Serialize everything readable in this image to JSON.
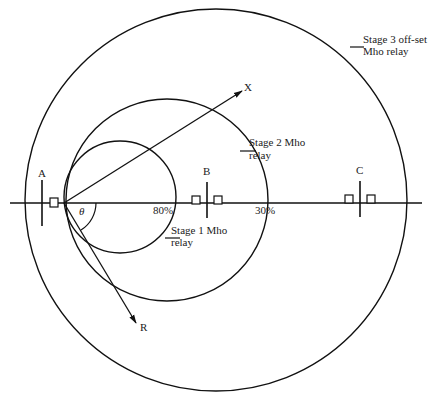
{
  "diagram": {
    "colors": {
      "line": "#111111",
      "text": "#222222",
      "background": "#ffffff"
    },
    "axes": {
      "x_label": "X",
      "r_label": "R",
      "angle_label": "θ"
    },
    "buses": [
      {
        "id": "A",
        "label": "A"
      },
      {
        "id": "B",
        "label": "B"
      },
      {
        "id": "C",
        "label": "C"
      }
    ],
    "reach_marks": {
      "stage1_reach": "80%",
      "stage2_overreach": "30%"
    },
    "zones": [
      {
        "id": "stage1",
        "label_line1": "Stage 1 Mho",
        "label_line2": "relay"
      },
      {
        "id": "stage2",
        "label_line1": "Stage 2  Mho",
        "label_line2": "relay"
      },
      {
        "id": "stage3",
        "label_line1": "Stage 3 off-set",
        "label_line2": "Mho relay"
      }
    ]
  }
}
